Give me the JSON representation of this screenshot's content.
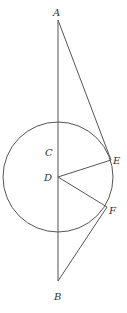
{
  "diagram": {
    "colors": {
      "stroke": "#555555",
      "label": "#333333",
      "background": "#ffffff"
    },
    "circle": {
      "cx": 58,
      "cy": 177,
      "r": 55
    },
    "points": {
      "A": {
        "x": 58,
        "y": 20,
        "label": "A"
      },
      "B": {
        "x": 58,
        "y": 281,
        "label": "B"
      },
      "C": {
        "x": 58,
        "y": 150,
        "label": "C"
      },
      "D": {
        "x": 58,
        "y": 177,
        "label": "D"
      },
      "E": {
        "x": 111,
        "y": 160,
        "label": "E"
      },
      "F": {
        "x": 107,
        "y": 207,
        "label": "F"
      }
    },
    "segments": [
      {
        "from": "A",
        "to": "B"
      },
      {
        "from": "A",
        "to": "E"
      },
      {
        "from": "B",
        "to": "F"
      },
      {
        "from": "D",
        "to": "E"
      },
      {
        "from": "D",
        "to": "F"
      }
    ],
    "labels": {
      "A": "A",
      "B": "B",
      "C": "C",
      "D": "D",
      "E": "E",
      "F": "F"
    }
  }
}
